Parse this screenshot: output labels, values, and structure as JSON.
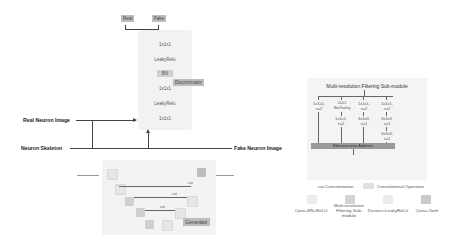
{
  "discriminator": {
    "outputs": [
      "Real",
      "Fake"
    ],
    "layers": [
      "1x1x1",
      "LeakyRelu",
      "BN",
      "1x1x1",
      "LeakyRelu",
      "1x1x1"
    ],
    "label": "Discriminator"
  },
  "inputs": {
    "real_neuron_image": "Real Neuron Image",
    "neuron_skeleton": "Neuron Skeleton",
    "fake_neuron_image": "Fake Neuron Image"
  },
  "generator": {
    "label": "Generator",
    "concat_labels": [
      "cat",
      "cat",
      "cat"
    ]
  },
  "multi_resolution": {
    "title": "Multi-resolution Filtering Sub-module",
    "branches": [
      [
        "1x1x1,\ns=2"
      ],
      [
        "2x2x1\nMaxPooling",
        "1x1x1,\ns=2"
      ],
      [
        "1x1x1,\ns=2",
        "3x3x3,\ns=1"
      ],
      [
        "1x1x1,\ns=2",
        "3x3x3,\ns=1",
        "3x3x3,\ns=1"
      ]
    ],
    "merge": "Element-wise Addition"
  },
  "legend": {
    "concat": "cat Concatenation",
    "conv_op": "Convolutional Operation",
    "items": [
      "Conv+BN+ReLU",
      "Multi-resolution Filtering Sub-module",
      "Deconv+LeakyReLU",
      "Conv+Tanh"
    ]
  },
  "colors": {
    "box_light": "#f2f2f2",
    "block_gray": "#cfcfcf",
    "tag_gray": "#bdbdbd",
    "line": "#444444"
  }
}
